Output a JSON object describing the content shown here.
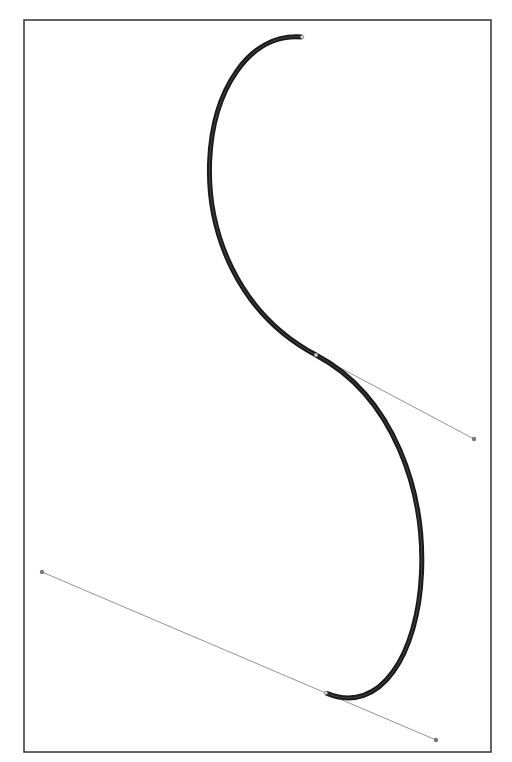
{
  "diagram": {
    "type": "bezier-path",
    "frame": {
      "x": 24,
      "y": 20,
      "width": 467,
      "height": 732,
      "stroke": "#333333"
    },
    "path": {
      "stroke": "#1a1a1a",
      "stroke_width": 5,
      "segments": [
        {
          "start": [
            302,
            37
          ],
          "cp1": [
            195,
            28
          ],
          "cp2": [
            158,
            271
          ],
          "end": [
            316,
            355
          ]
        },
        {
          "start": [
            316,
            355
          ],
          "cp1": [
            474,
            439
          ],
          "cp2": [
            436,
            740
          ],
          "end": [
            326,
            693
          ]
        }
      ]
    },
    "anchors": [
      {
        "name": "start-anchor",
        "x": 302,
        "y": 37
      },
      {
        "name": "mid-anchor",
        "x": 316,
        "y": 355
      },
      {
        "name": "end-anchor",
        "x": 326,
        "y": 693
      }
    ],
    "handles": [
      {
        "name": "mid-handle",
        "from": [
          316,
          355
        ],
        "to": [
          474,
          439
        ]
      },
      {
        "name": "end-handle",
        "from": [
          42,
          572
        ],
        "to": [
          436,
          740
        ]
      }
    ],
    "handle_color": "#888888"
  }
}
